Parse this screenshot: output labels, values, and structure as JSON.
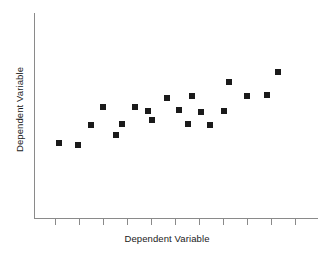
{
  "chart_data": {
    "type": "scatter",
    "title": "",
    "xlabel": "Dependent Variable",
    "ylabel": "Dependent Variable",
    "grid": false,
    "legend": null,
    "xlim": [
      0,
      11
    ],
    "ylim": [
      0,
      10
    ],
    "x_tick_labels": [
      "",
      "",
      "",
      "",
      "",
      "",
      "",
      "",
      "",
      "",
      ""
    ],
    "y_tick_labels": [],
    "marker": "square",
    "marker_color": "#1a1a1a",
    "marker_size_px": 6,
    "axis_color": "#8a8a8a",
    "n_points": 20,
    "points": [
      {
        "px": 59,
        "py": 143,
        "x": 1.05,
        "y": 3.65
      },
      {
        "px": 78,
        "py": 145,
        "x": 1.85,
        "y": 3.55
      },
      {
        "px": 91,
        "py": 125,
        "x": 2.4,
        "y": 4.55
      },
      {
        "px": 103,
        "py": 107,
        "x": 2.9,
        "y": 5.4
      },
      {
        "px": 116,
        "py": 135,
        "x": 3.45,
        "y": 4.05
      },
      {
        "px": 122,
        "py": 124,
        "x": 3.7,
        "y": 4.6
      },
      {
        "px": 135,
        "py": 107,
        "x": 4.25,
        "y": 5.4
      },
      {
        "px": 152,
        "py": 120,
        "x": 4.95,
        "y": 4.8
      },
      {
        "px": 167,
        "py": 98,
        "x": 5.55,
        "y": 5.85
      },
      {
        "px": 179,
        "py": 110,
        "x": 6.1,
        "y": 5.25
      },
      {
        "px": 188,
        "py": 124,
        "x": 6.45,
        "y": 4.6
      },
      {
        "px": 192,
        "py": 96,
        "x": 6.65,
        "y": 5.95
      },
      {
        "px": 201,
        "py": 112,
        "x": 7.0,
        "y": 5.15
      },
      {
        "px": 210,
        "py": 125,
        "x": 7.4,
        "y": 4.55
      },
      {
        "px": 224,
        "py": 111,
        "x": 7.95,
        "y": 5.2
      },
      {
        "px": 229,
        "py": 82,
        "x": 8.2,
        "y": 6.65
      },
      {
        "px": 247,
        "py": 96,
        "x": 8.95,
        "y": 5.95
      },
      {
        "px": 267,
        "py": 95,
        "x": 9.75,
        "y": 6.0
      },
      {
        "px": 278,
        "py": 72,
        "x": 10.2,
        "y": 7.15
      },
      {
        "px": 148,
        "py": 111,
        "x": 4.8,
        "y": 5.2
      }
    ],
    "x_ticks_px": [
      55,
      79,
      103,
      127,
      151,
      175,
      199,
      223,
      247,
      271,
      295
    ]
  },
  "axes": {
    "x_label": "Dependent Variable",
    "y_label": "Dependent Variable"
  }
}
